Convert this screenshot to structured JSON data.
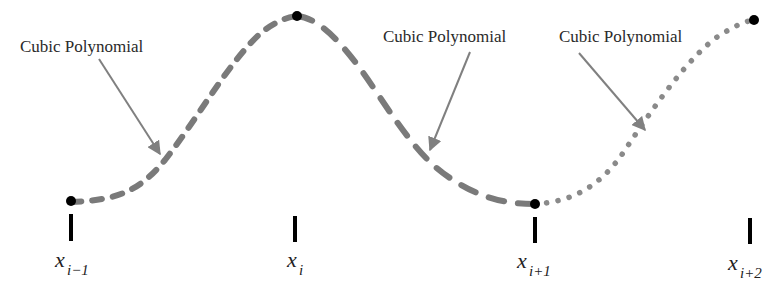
{
  "diagram": {
    "annotations": [
      {
        "text": "Cubic Polynomial",
        "segment": 1
      },
      {
        "text": "Cubic Polynomial",
        "segment": 2
      },
      {
        "text": "Cubic Polynomial",
        "segment": 3
      }
    ],
    "knots": [
      {
        "var": "x",
        "sub": "i−1"
      },
      {
        "var": "x",
        "sub": "i"
      },
      {
        "var": "x",
        "sub": "i+1"
      },
      {
        "var": "x",
        "sub": "i+2"
      }
    ],
    "segment_styles": [
      "dashed-short",
      "dashed-long",
      "dotted"
    ],
    "colors": {
      "curve": "#7a7a7a",
      "arrow": "#808080",
      "knot": "#000000",
      "tick": "#000000",
      "text": "#2a2a2a"
    }
  }
}
